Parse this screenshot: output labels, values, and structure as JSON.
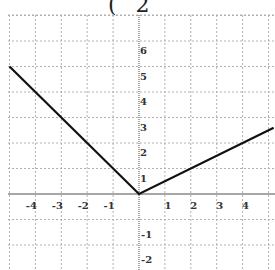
{
  "title_fragment": "( 2",
  "chart_data": {
    "type": "line",
    "title": "",
    "xlabel": "",
    "ylabel": "",
    "xlim": [
      -5,
      5.2
    ],
    "ylim": [
      -3,
      7
    ],
    "grid": true,
    "x_tick_labels": [
      "-4",
      "-3",
      "-2",
      "-1",
      "1",
      "2",
      "3",
      "4"
    ],
    "y_tick_labels": [
      "6",
      "5",
      "4",
      "3",
      "2",
      "1",
      "-1",
      "-2"
    ],
    "series": [
      {
        "name": "piecewise",
        "color": "#111111",
        "points": [
          [
            -5,
            5
          ],
          [
            0,
            0
          ],
          [
            5.2,
            2.6
          ]
        ]
      }
    ]
  },
  "colors": {
    "grid": "#b0b0b0",
    "axis": "#888888",
    "line": "#111111"
  }
}
